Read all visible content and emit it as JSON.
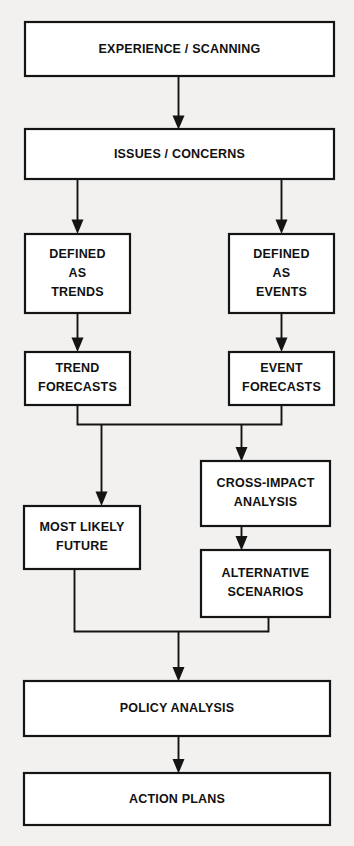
{
  "diagram": {
    "background_color": "#f2f1ef",
    "box_fill": "#ffffff",
    "line_color": "#141414",
    "nodes": [
      {
        "id": "experience",
        "label": "EXPERIENCE / SCANNING",
        "lines": [
          "EXPERIENCE / SCANNING"
        ]
      },
      {
        "id": "issues",
        "label": "ISSUES / CONCERNS",
        "lines": [
          "ISSUES / CONCERNS"
        ]
      },
      {
        "id": "trends",
        "label": "DEFINED AS TRENDS",
        "lines": [
          "DEFINED",
          "AS",
          "TRENDS"
        ]
      },
      {
        "id": "events",
        "label": "DEFINED AS EVENTS",
        "lines": [
          "DEFINED",
          "AS",
          "EVENTS"
        ]
      },
      {
        "id": "trendfc",
        "label": "TREND FORECASTS",
        "lines": [
          "TREND",
          "FORECASTS"
        ]
      },
      {
        "id": "eventfc",
        "label": "EVENT FORECASTS",
        "lines": [
          "EVENT",
          "FORECASTS"
        ]
      },
      {
        "id": "crossimpact",
        "label": "CROSS-IMPACT ANALYSIS",
        "lines": [
          "CROSS-IMPACT",
          "ANALYSIS"
        ]
      },
      {
        "id": "mostlikely",
        "label": "MOST LIKELY FUTURE",
        "lines": [
          "MOST LIKELY",
          "FUTURE"
        ]
      },
      {
        "id": "alternative",
        "label": "ALTERNATIVE SCENARIOS",
        "lines": [
          "ALTERNATIVE",
          "SCENARIOS"
        ]
      },
      {
        "id": "policy",
        "label": "POLICY ANALYSIS",
        "lines": [
          "POLICY ANALYSIS"
        ]
      },
      {
        "id": "action",
        "label": "ACTION PLANS",
        "lines": [
          "ACTION PLANS"
        ]
      }
    ],
    "text": {
      "experience": "EXPERIENCE / SCANNING",
      "issues": "ISSUES / CONCERNS",
      "trends_l1": "DEFINED",
      "trends_l2": "AS",
      "trends_l3": "TRENDS",
      "events_l1": "DEFINED",
      "events_l2": "AS",
      "events_l3": "EVENTS",
      "trendfc_l1": "TREND",
      "trendfc_l2": "FORECASTS",
      "eventfc_l1": "EVENT",
      "eventfc_l2": "FORECASTS",
      "crossimpact_l1": "CROSS-IMPACT",
      "crossimpact_l2": "ANALYSIS",
      "mostlikely_l1": "MOST LIKELY",
      "mostlikely_l2": "FUTURE",
      "alternative_l1": "ALTERNATIVE",
      "alternative_l2": "SCENARIOS",
      "policy": "POLICY ANALYSIS",
      "action": "ACTION PLANS"
    },
    "edges": [
      {
        "from": "experience",
        "to": "issues",
        "arrow": true
      },
      {
        "from": "issues",
        "to": "trends",
        "arrow": true
      },
      {
        "from": "issues",
        "to": "events",
        "arrow": true
      },
      {
        "from": "trends",
        "to": "trendfc",
        "arrow": true
      },
      {
        "from": "events",
        "to": "eventfc",
        "arrow": true
      },
      {
        "from": "trendfc",
        "to": "mostlikely",
        "arrow": true
      },
      {
        "from": "eventfc",
        "to": "crossimpact",
        "arrow": true
      },
      {
        "from": "crossimpact",
        "to": "alternative",
        "arrow": true
      },
      {
        "from": "mostlikely",
        "to": "policy",
        "arrow": true
      },
      {
        "from": "alternative",
        "to": "policy",
        "arrow": true
      },
      {
        "from": "policy",
        "to": "action",
        "arrow": true
      }
    ]
  }
}
